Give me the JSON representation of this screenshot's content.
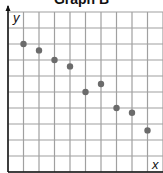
{
  "chart_data": {
    "type": "scatter",
    "title": "Graph B",
    "xlabel": "x",
    "ylabel": "y",
    "xlim": [
      0,
      10
    ],
    "ylim": [
      0,
      10
    ],
    "grid": true,
    "tick_labels": false,
    "points": [
      {
        "x": 1,
        "y": 8
      },
      {
        "x": 2,
        "y": 7.6
      },
      {
        "x": 3,
        "y": 7
      },
      {
        "x": 4,
        "y": 6.6
      },
      {
        "x": 5,
        "y": 5
      },
      {
        "x": 6,
        "y": 5.5
      },
      {
        "x": 7,
        "y": 4
      },
      {
        "x": 8,
        "y": 3.7
      },
      {
        "x": 9,
        "y": 2.6
      }
    ]
  },
  "colors": {
    "grid": "#a0a0a0",
    "axis": "#111111",
    "point": "#6b6b6b"
  }
}
